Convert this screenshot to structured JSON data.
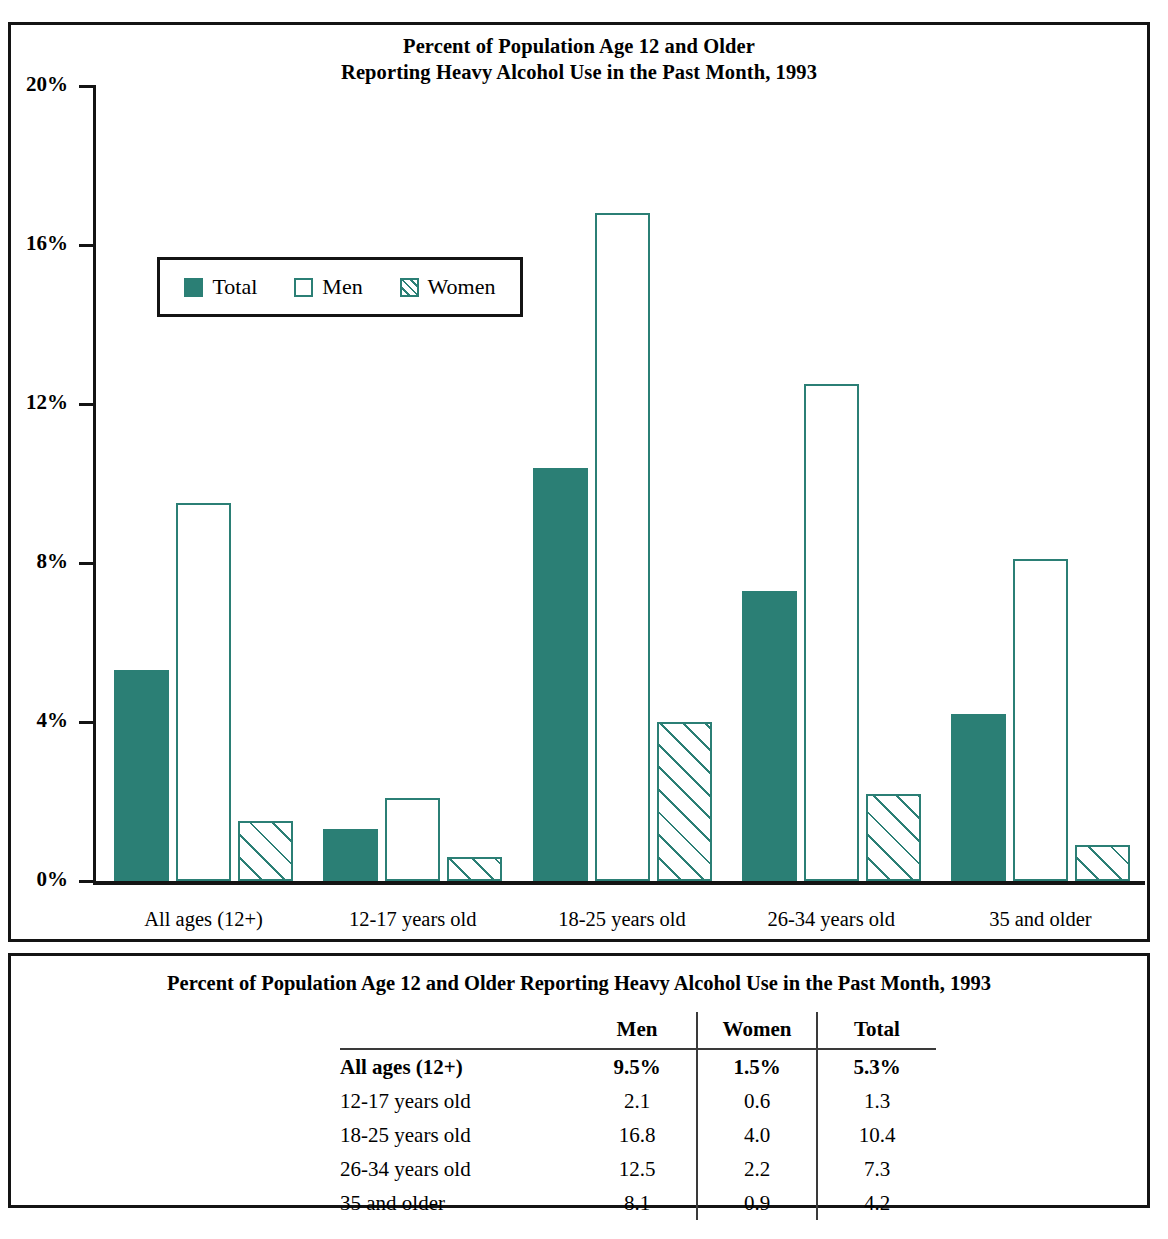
{
  "chart_panel": {
    "title_line1": "Percent of Population Age 12 and Older",
    "title_line2": "Reporting Heavy Alcohol Use in the Past Month, 1993"
  },
  "legend": {
    "items": [
      {
        "label": "Total",
        "style": "total",
        "color": "#2b7f75"
      },
      {
        "label": "Men",
        "style": "men",
        "color": "#2b7f75"
      },
      {
        "label": "Women",
        "style": "women",
        "color": "#2b7f75"
      }
    ]
  },
  "axis": {
    "y_ticks": [
      "20%",
      "16%",
      "12%",
      "8%",
      "4%",
      "0%"
    ]
  },
  "table_panel": {
    "title": "Percent of Population Age 12 and Older Reporting Heavy Alcohol Use in the Past Month, 1993",
    "headers": [
      "",
      "Men",
      "Women",
      "Total"
    ],
    "rows": [
      {
        "label": "All ages (12+)",
        "men": "9.5%",
        "women": "1.5%",
        "total": "5.3%"
      },
      {
        "label": "12-17 years old",
        "men": "2.1",
        "women": "0.6",
        "total": "1.3"
      },
      {
        "label": "18-25 years old",
        "men": "16.8",
        "women": "4.0",
        "total": "10.4"
      },
      {
        "label": "26-34 years old",
        "men": "12.5",
        "women": "2.2",
        "total": "7.3"
      },
      {
        "label": "35 and older",
        "men": "8.1",
        "women": "0.9",
        "total": "4.2"
      }
    ]
  },
  "chart_data": {
    "type": "bar",
    "title": "Percent of Population Age 12 and Older Reporting Heavy Alcohol Use in the Past Month, 1993",
    "xlabel": "",
    "ylabel": "",
    "ylim": [
      0,
      20
    ],
    "ytick_values": [
      0,
      4,
      8,
      12,
      16,
      20
    ],
    "ytick_labels": [
      "0%",
      "4%",
      "8%",
      "12%",
      "16%",
      "20%"
    ],
    "grid": false,
    "legend_position": "upper-left-inside",
    "categories": [
      "All ages (12+)",
      "12-17 years old",
      "18-25 years old",
      "26-34 years old",
      "35 and older"
    ],
    "series": [
      {
        "name": "Total",
        "style": "solid",
        "color": "#2b7f75",
        "values": [
          5.3,
          1.3,
          10.4,
          7.3,
          4.2
        ]
      },
      {
        "name": "Men",
        "style": "open",
        "color": "#2b7f75",
        "values": [
          9.5,
          2.1,
          16.8,
          12.5,
          8.1
        ]
      },
      {
        "name": "Women",
        "style": "hatched",
        "color": "#2b7f75",
        "values": [
          1.5,
          0.6,
          4.0,
          2.2,
          0.9
        ]
      }
    ]
  }
}
